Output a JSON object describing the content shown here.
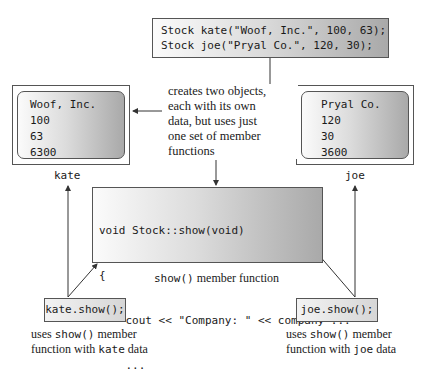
{
  "declaration": {
    "lines": [
      "Stock kate(\"Woof, Inc.\", 100, 63);",
      "Stock joe(\"Pryal Co.\", 120, 30);"
    ]
  },
  "objects": {
    "kate": {
      "label": "kate",
      "values": [
        "Woof, Inc.",
        "100",
        "63",
        "6300"
      ]
    },
    "joe": {
      "label": "joe",
      "values": [
        "Pryal Co.",
        "120",
        "30",
        "3600"
      ]
    }
  },
  "description": {
    "lines": [
      "creates two objects,",
      "each with its own",
      "data, but uses just",
      "one set of member",
      "functions"
    ]
  },
  "member_function": {
    "code_lines": [
      "void Stock::show(void)",
      "{",
      "    cout << \"Company: \" << company ...",
      "    ...",
      "}"
    ],
    "caption_code": "show()",
    "caption_text": " member function"
  },
  "calls": {
    "kate": {
      "code": "kate.show();",
      "note_line1_prefix": "uses ",
      "note_line1_code": "show()",
      "note_line1_suffix": " member",
      "note_line2_prefix": "function with ",
      "note_line2_code": "kate",
      "note_line2_suffix": " data"
    },
    "joe": {
      "code": "joe.show();",
      "note_line1_prefix": "uses ",
      "note_line1_code": "show()",
      "note_line1_suffix": " member",
      "note_line2_prefix": "function with ",
      "note_line2_code": "joe",
      "note_line2_suffix": " data"
    }
  },
  "colors": {
    "line": "#333333",
    "gradient_light": "#fbfbfb",
    "gradient_dark": "#a9a9a9"
  }
}
